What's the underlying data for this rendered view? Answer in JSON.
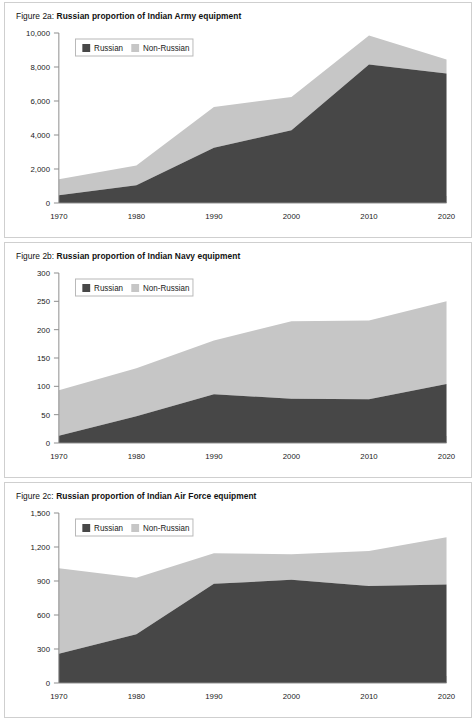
{
  "figures": [
    {
      "id": "fig-2a",
      "label": "Figure 2a:",
      "title": "Russian proportion of Indian Army equipment",
      "legend": {
        "russian": "Russian",
        "non_russian": "Non-Russian"
      },
      "chart_data": {
        "type": "area",
        "stacked": true,
        "title": "Russian proportion of Indian Army equipment",
        "xlabel": "",
        "ylabel": "",
        "x": [
          1970,
          1980,
          1990,
          2000,
          2010,
          2020
        ],
        "categories": [
          "1970",
          "1980",
          "1990",
          "2000",
          "2010",
          "2020"
        ],
        "xtick_labels": [
          "1970",
          "1980",
          "1990",
          "2000",
          "2010",
          "2020"
        ],
        "ytick_labels": [
          "0",
          "2,000",
          "4,000",
          "6,000",
          "8,000",
          "10,000"
        ],
        "ytick_values": [
          0,
          2000,
          4000,
          6000,
          8000,
          10000
        ],
        "ylim": [
          0,
          10000
        ],
        "xlim": [
          1970,
          2020
        ],
        "grid": false,
        "legend_position": "top-left-inside",
        "series": [
          {
            "name": "Russian",
            "color": "#474747",
            "values": [
              450,
              1050,
              3250,
              4280,
              8150,
              7620
            ]
          },
          {
            "name": "Non-Russian",
            "color": "#c6c6c6",
            "values": [
              950,
              1150,
              2400,
              1950,
              1700,
              820
            ]
          }
        ],
        "totals": [
          1400,
          2200,
          5650,
          6230,
          9850,
          8440
        ]
      }
    },
    {
      "id": "fig-2b",
      "label": "Figure 2b:",
      "title": "Russian proportion of Indian Navy equipment",
      "legend": {
        "russian": "Russian",
        "non_russian": "Non-Russian"
      },
      "chart_data": {
        "type": "area",
        "stacked": true,
        "title": "Russian proportion of Indian Navy equipment",
        "xlabel": "",
        "ylabel": "",
        "x": [
          1970,
          1980,
          1990,
          2000,
          2010,
          2020
        ],
        "categories": [
          "1970",
          "1980",
          "1990",
          "2000",
          "2010",
          "2020"
        ],
        "xtick_labels": [
          "1970",
          "1980",
          "1990",
          "2000",
          "2010",
          "2020"
        ],
        "ytick_labels": [
          "0",
          "50",
          "100",
          "150",
          "200",
          "250",
          "300"
        ],
        "ytick_values": [
          0,
          50,
          100,
          150,
          200,
          250,
          300
        ],
        "ylim": [
          0,
          300
        ],
        "xlim": [
          1970,
          2020
        ],
        "grid": false,
        "legend_position": "top-left-inside",
        "series": [
          {
            "name": "Russian",
            "color": "#474747",
            "values": [
              13,
              47,
              86,
              78,
              77,
              104
            ]
          },
          {
            "name": "Non-Russian",
            "color": "#c6c6c6",
            "values": [
              80,
              85,
              95,
              137,
              139,
              146
            ]
          }
        ],
        "totals": [
          93,
          132,
          181,
          215,
          216,
          250
        ]
      }
    },
    {
      "id": "fig-2c",
      "label": "Figure 2c:",
      "title": "Russian proportion of Indian Air Force equipment",
      "legend": {
        "russian": "Russian",
        "non_russian": "Non-Russian"
      },
      "chart_data": {
        "type": "area",
        "stacked": true,
        "title": "Russian proportion of Indian Air Force equipment",
        "xlabel": "",
        "ylabel": "",
        "x": [
          1970,
          1980,
          1990,
          2000,
          2010,
          2020
        ],
        "categories": [
          "1970",
          "1980",
          "1990",
          "2000",
          "2010",
          "2020"
        ],
        "xtick_labels": [
          "1970",
          "1980",
          "1990",
          "2000",
          "2010",
          "2020"
        ],
        "ytick_labels": [
          "0",
          "300",
          "600",
          "900",
          "1,200",
          "1,500"
        ],
        "ytick_values": [
          0,
          300,
          600,
          900,
          1200,
          1500
        ],
        "ylim": [
          0,
          1500
        ],
        "xlim": [
          1970,
          2020
        ],
        "grid": false,
        "legend_position": "top-left-inside",
        "series": [
          {
            "name": "Russian",
            "color": "#474747",
            "values": [
              258,
              430,
              875,
              910,
              855,
              870
            ]
          },
          {
            "name": "Non-Russian",
            "color": "#c6c6c6",
            "values": [
              754,
              498,
              270,
              225,
              310,
              415
            ]
          }
        ],
        "totals": [
          1012,
          928,
          1145,
          1135,
          1165,
          1285
        ]
      }
    }
  ],
  "colors": {
    "russian": "#474747",
    "non_russian": "#c6c6c6",
    "axis": "#8d8d8d",
    "border": "#cfcfcf",
    "text": "#1a1a1a",
    "background": "#ffffff"
  }
}
